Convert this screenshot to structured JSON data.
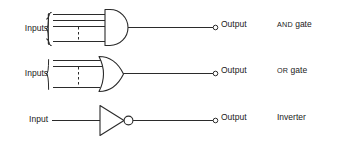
{
  "diagram": {
    "background_color": "#ffffff",
    "line_color": "#2b2b2b"
  },
  "rows": [
    {
      "id": "and-gate",
      "gate_name": "AND gate",
      "gate_name_caps_part": "AND",
      "gate_name_rest": "gate",
      "input_label": "Inputs",
      "output_label": "Output",
      "input_count": 4,
      "has_brace": true,
      "has_dashed_separator": true,
      "has_output_bubble": false,
      "shape": "d-shape"
    },
    {
      "id": "or-gate",
      "gate_name": "OR gate",
      "gate_name_caps_part": "OR",
      "gate_name_rest": "gate",
      "input_label": "Inputs",
      "output_label": "Output",
      "input_count": 3,
      "has_brace": true,
      "has_dashed_separator": true,
      "has_output_bubble": false,
      "shape": "shield-shape"
    },
    {
      "id": "inverter",
      "gate_name": "Inverter",
      "gate_name_caps_part": "",
      "gate_name_rest": "Inverter",
      "input_label": "Input",
      "output_label": "Output",
      "input_count": 1,
      "has_brace": false,
      "has_dashed_separator": false,
      "has_output_bubble": true,
      "shape": "triangle-bubble"
    }
  ]
}
